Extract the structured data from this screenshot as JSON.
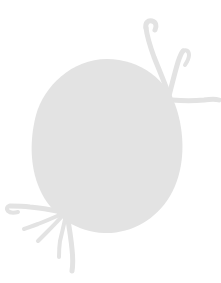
{
  "canvas": {
    "width": 221,
    "height": 283,
    "background_color": "#ffffff",
    "description": "Faded light-gray silhouette watermark of a bird-like figure on a blank white canvas. No text, labels, buttons or UI chrome are visible."
  },
  "figure": {
    "name": "bird-silhouette",
    "fill_color": "#e3e3e3",
    "stroke_color": "#e3e3e3",
    "opacity": "1",
    "parts": {
      "body": {
        "label": "egg-shaped body",
        "center_x": 107,
        "center_y": 143,
        "radius_x": 76,
        "radius_y": 83
      },
      "upper_right_twigs": {
        "label": "upper-right branching twig limb",
        "branch_count": 4,
        "tip_x": 146,
        "tip_y": 25
      },
      "lower_left_twigs": {
        "label": "lower-left branching twig limb",
        "branch_count": 5,
        "tip_x": 10,
        "tip_y": 205
      }
    }
  },
  "geometry": {
    "body_path": "M 107 59 C 140 59 168 80 177 110 C 186 140 184 172 170 196 C 156 220 130 234 104 233 C 78 232 54 217 42 194 C 30 171 29 142 36 115 C 44 86 72 59 107 59 Z",
    "twig_strokes": [
      {
        "name": "upper-main-stem",
        "d": "M 170 98 C 166 86 160 72 154 57 C 150 46 147 36 146 28",
        "width": 5
      },
      {
        "name": "upper-hook-tip",
        "d": "M 146 28 C 145 23 148 20 152 21 C 156 22 157 26 155 30",
        "width": 5
      },
      {
        "name": "upper-second-branch",
        "d": "M 169 96 C 172 84 175 72 178 62 C 180 56 181 53 183 51",
        "width": 5
      },
      {
        "name": "upper-second-kink",
        "d": "M 183 51 C 186 49 189 51 189 55 C 189 59 187 62 185 65",
        "width": 4
      },
      {
        "name": "upper-right-branch",
        "d": "M 172 100 C 183 101 194 101 204 100 C 211 99 216 99 219 100",
        "width": 5
      },
      {
        "name": "upper-short-spur",
        "d": "M 171 101 C 173 107 175 112 176 117",
        "width": 4
      },
      {
        "name": "lower-main-stem",
        "d": "M 62 212 C 52 210 41 208 30 207 C 22 206 15 206 10 206",
        "width": 5
      },
      {
        "name": "lower-stem-tip",
        "d": "M 10 206 C 7 206 6 209 8 211 C 10 213 14 213 18 212",
        "width": 4
      },
      {
        "name": "lower-branch-a",
        "d": "M 64 213 C 55 217 46 221 38 224 C 32 226 27 228 24 229",
        "width": 4
      },
      {
        "name": "lower-branch-b",
        "d": "M 64 214 C 58 221 52 227 47 232 C 43 236 40 239 38 241",
        "width": 4
      },
      {
        "name": "lower-branch-c",
        "d": "M 66 215 C 64 224 62 233 60 241 C 59 248 59 253 59 257",
        "width": 4
      },
      {
        "name": "lower-descender",
        "d": "M 67 214 C 69 226 71 238 72 249 C 73 258 73 265 72 271",
        "width": 5
      }
    ]
  }
}
